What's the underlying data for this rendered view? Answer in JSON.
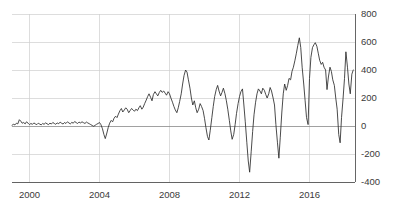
{
  "chart_data": {
    "type": "line",
    "title": "",
    "subtitle": "",
    "xlabel": "",
    "ylabel": "",
    "grid": true,
    "legend": null,
    "y_axis_position": "right",
    "xlim": [
      1999.0,
      2018.6
    ],
    "ylim": [
      -400,
      800
    ],
    "yticks": [
      -400,
      -200,
      0,
      200,
      400,
      600,
      800
    ],
    "ytick_labels": [
      "-400",
      "-200",
      "0",
      "200",
      "400",
      "600",
      "800"
    ],
    "xticks": [
      2000,
      2004,
      2008,
      2012,
      2016
    ],
    "xtick_labels": [
      "2000",
      "2004",
      "2008",
      "2012",
      "2016"
    ],
    "line_color": "#2b2b2b",
    "grid_color": "#cfcfcf",
    "zero_line_color": "#8a8a8a",
    "series": [
      {
        "name": "series-1",
        "x": [
          1999.0,
          1999.08,
          1999.17,
          1999.25,
          1999.33,
          1999.42,
          1999.5,
          1999.58,
          1999.67,
          1999.75,
          1999.83,
          1999.92,
          2000.0,
          2000.08,
          2000.17,
          2000.25,
          2000.33,
          2000.42,
          2000.5,
          2000.58,
          2000.67,
          2000.75,
          2000.83,
          2000.92,
          2001.0,
          2001.08,
          2001.17,
          2001.25,
          2001.33,
          2001.42,
          2001.5,
          2001.58,
          2001.67,
          2001.75,
          2001.83,
          2001.92,
          2002.0,
          2002.08,
          2002.17,
          2002.25,
          2002.33,
          2002.42,
          2002.5,
          2002.58,
          2002.67,
          2002.75,
          2002.83,
          2002.92,
          2003.0,
          2003.08,
          2003.17,
          2003.25,
          2003.33,
          2003.42,
          2003.5,
          2003.58,
          2003.67,
          2003.75,
          2003.83,
          2003.92,
          2004.0,
          2004.08,
          2004.17,
          2004.25,
          2004.33,
          2004.42,
          2004.5,
          2004.58,
          2004.67,
          2004.75,
          2004.83,
          2004.92,
          2005.0,
          2005.08,
          2005.17,
          2005.25,
          2005.33,
          2005.42,
          2005.5,
          2005.58,
          2005.67,
          2005.75,
          2005.83,
          2005.92,
          2006.0,
          2006.08,
          2006.17,
          2006.25,
          2006.33,
          2006.42,
          2006.5,
          2006.58,
          2006.67,
          2006.75,
          2006.83,
          2006.92,
          2007.0,
          2007.08,
          2007.17,
          2007.25,
          2007.33,
          2007.42,
          2007.5,
          2007.58,
          2007.67,
          2007.75,
          2007.83,
          2007.92,
          2008.0,
          2008.08,
          2008.17,
          2008.25,
          2008.33,
          2008.42,
          2008.5,
          2008.58,
          2008.67,
          2008.75,
          2008.83,
          2008.92,
          2009.0,
          2009.08,
          2009.17,
          2009.25,
          2009.33,
          2009.42,
          2009.5,
          2009.58,
          2009.67,
          2009.75,
          2009.83,
          2009.92,
          2010.0,
          2010.08,
          2010.17,
          2010.25,
          2010.33,
          2010.42,
          2010.5,
          2010.58,
          2010.67,
          2010.75,
          2010.83,
          2010.92,
          2011.0,
          2011.08,
          2011.17,
          2011.25,
          2011.33,
          2011.42,
          2011.5,
          2011.58,
          2011.67,
          2011.75,
          2011.83,
          2011.92,
          2012.0,
          2012.08,
          2012.17,
          2012.25,
          2012.33,
          2012.42,
          2012.5,
          2012.58,
          2012.67,
          2012.75,
          2012.83,
          2012.92,
          2013.0,
          2013.08,
          2013.17,
          2013.25,
          2013.33,
          2013.42,
          2013.5,
          2013.58,
          2013.67,
          2013.75,
          2013.83,
          2013.92,
          2014.0,
          2014.08,
          2014.17,
          2014.25,
          2014.33,
          2014.42,
          2014.5,
          2014.58,
          2014.67,
          2014.75,
          2014.83,
          2014.92,
          2015.0,
          2015.08,
          2015.17,
          2015.25,
          2015.33,
          2015.42,
          2015.5,
          2015.58,
          2015.67,
          2015.75,
          2015.83,
          2015.92,
          2016.0,
          2016.08,
          2016.17,
          2016.25,
          2016.33,
          2016.42,
          2016.5,
          2016.58,
          2016.67,
          2016.75,
          2016.83,
          2016.92,
          2017.0,
          2017.08,
          2017.17,
          2017.25,
          2017.33,
          2017.42,
          2017.5,
          2017.58,
          2017.67,
          2017.75,
          2017.83,
          2017.92,
          2018.0,
          2018.08,
          2018.17,
          2018.25,
          2018.33,
          2018.42,
          2018.5
        ],
        "values": [
          5,
          12,
          8,
          20,
          15,
          45,
          35,
          20,
          25,
          15,
          30,
          20,
          10,
          18,
          12,
          22,
          15,
          10,
          20,
          14,
          8,
          18,
          12,
          22,
          16,
          10,
          20,
          14,
          25,
          18,
          12,
          22,
          16,
          28,
          20,
          14,
          25,
          18,
          30,
          22,
          15,
          26,
          20,
          32,
          24,
          18,
          28,
          22,
          30,
          24,
          18,
          28,
          22,
          16,
          10,
          4,
          -2,
          5,
          12,
          18,
          25,
          10,
          -20,
          -60,
          -90,
          -50,
          -10,
          20,
          40,
          30,
          55,
          70,
          60,
          85,
          110,
          125,
          100,
          115,
          130,
          120,
          95,
          110,
          125,
          115,
          105,
          120,
          110,
          130,
          145,
          120,
          135,
          160,
          185,
          210,
          230,
          205,
          180,
          225,
          245,
          230,
          215,
          240,
          255,
          240,
          250,
          235,
          220,
          245,
          230,
          200,
          170,
          140,
          115,
          95,
          130,
          175,
          230,
          300,
          360,
          400,
          385,
          330,
          270,
          200,
          150,
          180,
          130,
          95,
          120,
          160,
          140,
          110,
          55,
          -10,
          -75,
          -100,
          -30,
          60,
          140,
          210,
          260,
          290,
          250,
          215,
          240,
          270,
          230,
          180,
          120,
          40,
          -35,
          -95,
          -60,
          10,
          90,
          160,
          210,
          245,
          265,
          150,
          30,
          -120,
          -250,
          -330,
          -180,
          -40,
          80,
          170,
          230,
          265,
          250,
          230,
          270,
          255,
          225,
          200,
          230,
          275,
          250,
          200,
          150,
          10,
          -120,
          -230,
          -80,
          100,
          230,
          300,
          255,
          290,
          340,
          330,
          390,
          420,
          470,
          520,
          575,
          630,
          560,
          420,
          300,
          180,
          60,
          10,
          340,
          490,
          560,
          580,
          595,
          570,
          520,
          470,
          440,
          455,
          420,
          400,
          260,
          350,
          420,
          390,
          330,
          290,
          200,
          120,
          -60,
          -120,
          60,
          200,
          340,
          530,
          420,
          300,
          230,
          370,
          400
        ],
        "units": "",
        "note": "Series fluctuates near 0 from 1999 to 2003, dips to about -90 in 2004, then trends upward with increasing volatility; deep negative spikes near 2012 (-330), 2014 (-230) and 2017 (-120); peak near 630 in mid-2015; ends near 400 in 2018."
      }
    ]
  }
}
